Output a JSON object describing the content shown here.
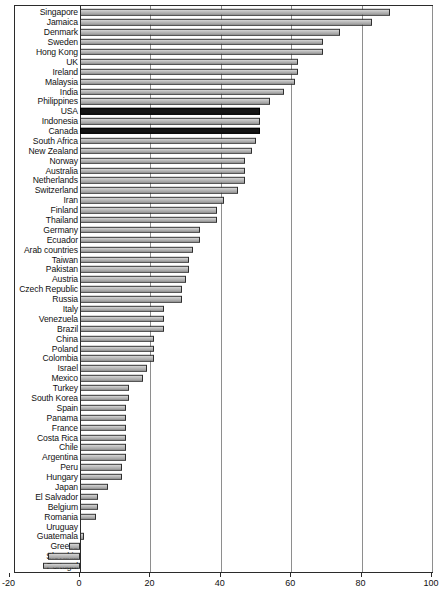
{
  "chart_data": {
    "type": "bar",
    "orientation": "horizontal",
    "title": "",
    "xlabel": "",
    "ylabel": "",
    "xlim": [
      -20,
      100
    ],
    "xticks": [
      -20,
      0,
      20,
      40,
      60,
      80,
      100
    ],
    "xtick_labels": [
      "-20",
      "0",
      "20",
      "40",
      "60",
      "80",
      "100"
    ],
    "grid": "vertical",
    "legend": "none",
    "highlight_color": "#151515",
    "bar_color": "#b5b5b5",
    "bar_edge_color": "#2e2e2e",
    "highlighted_categories": [
      "USA",
      "Canada"
    ],
    "categories": [
      "Singapore",
      "Jamaica",
      "Denmark",
      "Sweden",
      "Hong Kong",
      "UK",
      "Ireland",
      "Malaysia",
      "India",
      "Philippines",
      "USA",
      "Indonesia",
      "Canada",
      "South Africa",
      "New Zealand",
      "Norway",
      "Australia",
      "Netherlands",
      "Switzerland",
      "Iran",
      "Finland",
      "Thailand",
      "Germany",
      "Ecuador",
      "Arab countries",
      "Taiwan",
      "Pakistan",
      "Austria",
      "Czech Republic",
      "Russia",
      "Italy",
      "Venezuela",
      "Brazil",
      "China",
      "Poland",
      "Colombia",
      "Israel",
      "Mexico",
      "Turkey",
      "South Korea",
      "Spain",
      "Panama",
      "France",
      "Costa Rica",
      "Chile",
      "Argentina",
      "Peru",
      "Hungary",
      "Japan",
      "El Salvador",
      "Belgium",
      "Romania",
      "Uruguay",
      "Guatemala",
      "Greece",
      "Slovakia",
      "Portugal"
    ],
    "values": [
      88,
      83,
      74,
      69,
      69,
      62,
      62,
      61,
      58,
      54,
      51,
      51,
      51,
      50,
      49,
      47,
      47,
      47,
      45,
      41,
      39,
      39,
      34,
      34,
      32,
      31,
      31,
      30,
      29,
      29,
      24,
      24,
      24,
      21,
      21,
      21,
      19,
      18,
      14,
      14,
      13,
      13,
      13,
      13,
      13,
      13,
      12,
      12,
      8,
      5,
      5,
      4.5,
      0,
      1,
      -3,
      -9,
      -10.5
    ]
  },
  "axis": {
    "x_title": ""
  }
}
